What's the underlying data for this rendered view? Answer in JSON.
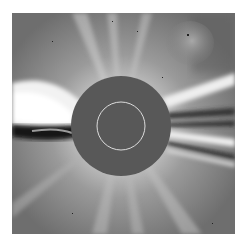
{
  "image": {
    "description": "White-light coronagraph image of the solar corona with central occulting disk",
    "occulter_color": "#585858",
    "background_color": "#7a7a7a",
    "sun_limb_circle_color": "#dcdcdc",
    "frame": {
      "left": 12,
      "top": 13,
      "width": 223,
      "height": 221
    },
    "occulter": {
      "cx": 109,
      "cy": 113,
      "r": 50
    },
    "sun_limb": {
      "cx": 109,
      "cy": 113,
      "r": 24
    }
  }
}
